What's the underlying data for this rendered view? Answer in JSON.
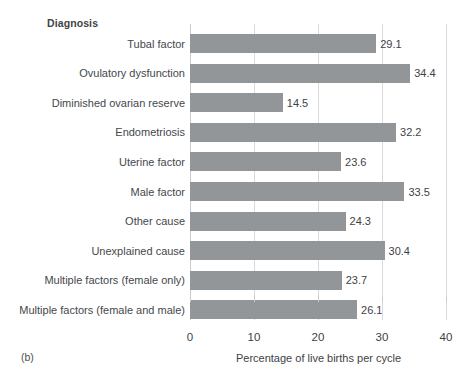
{
  "figure": {
    "panel_caption": "(b)",
    "category_axis_title": "Diagnosis"
  },
  "chart_data": {
    "type": "bar",
    "orientation": "horizontal",
    "title": "",
    "subtitle": "",
    "xlabel": "Percentage of live births per cycle",
    "ylabel": "Diagnosis",
    "xlim": [
      0,
      40
    ],
    "xticks": [
      0,
      10,
      20,
      30,
      40
    ],
    "xtick_labels": [
      "0",
      "10",
      "20",
      "30",
      "40"
    ],
    "grid": "vertical",
    "legend": "none",
    "bar_color": "#939699",
    "categories": [
      "Tubal factor",
      "Ovulatory dysfunction",
      "Diminished ovarian reserve",
      "Endometriosis",
      "Uterine factor",
      "Male factor",
      "Other cause",
      "Unexplained cause",
      "Multiple factors (female only)",
      "Multiple factors (female and male)"
    ],
    "values": [
      29.1,
      34.4,
      14.5,
      32.2,
      23.6,
      33.5,
      24.3,
      30.4,
      23.7,
      26.1
    ],
    "value_labels": [
      "29.1",
      "34.4",
      "14.5",
      "32.2",
      "23.6",
      "33.5",
      "24.3",
      "30.4",
      "23.7",
      "26.1"
    ]
  }
}
